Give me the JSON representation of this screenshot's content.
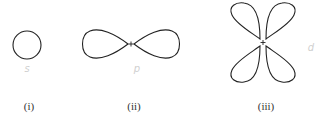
{
  "diagrams": [
    {
      "id": "s",
      "caption": "(i)",
      "annotation": "s"
    },
    {
      "id": "p",
      "caption": "(ii)",
      "annotation": "p"
    },
    {
      "id": "d",
      "caption": "(iii)",
      "annotation": "d"
    }
  ],
  "nucleus_symbol": "+",
  "colors": {
    "stroke": "#222222",
    "caption": "#333333",
    "annotation": "#d0d0d0"
  }
}
